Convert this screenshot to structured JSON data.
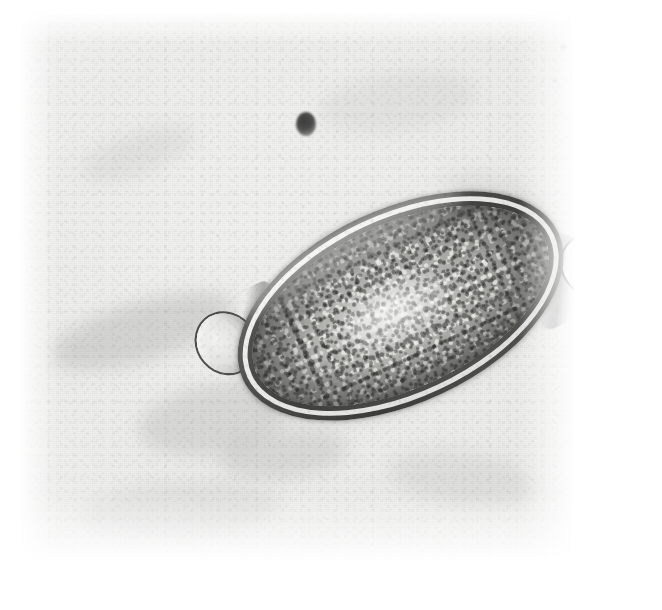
{
  "image": {
    "kind": "light-micrograph",
    "modality": "brightfield light microscopy (halftone printed photograph)",
    "subject": "Trichuris trichiura (whipworm) egg",
    "orientation_degrees": -25,
    "background_tone": "#efefee",
    "paper_tone": "#ffffff",
    "caption": ""
  },
  "field": {
    "left": 18,
    "top": 12,
    "width": 556,
    "height": 548,
    "description": "uniform pale grey out-of-focus slide background with film grain and halftone screen"
  },
  "specimen": {
    "name": "whipworm-egg",
    "shape": "barrel / lemon-shaped (football-shaped)",
    "long_axis_px": 386,
    "short_axis_px": 194,
    "tilt_degrees": -25,
    "shell": {
      "layers": [
        "outer dark rim",
        "clear refractile middle layer",
        "inner dark layer"
      ],
      "rim_color": "#3b3b39",
      "gap_color": "#eeeeec"
    },
    "contents": {
      "label": "granular unsegmented ovum",
      "base_color": "#b3b3b0",
      "highlight_color": "#f2f2ee",
      "granule_dark": "#6a6a67"
    },
    "plugs": [
      {
        "name": "polar-plug-left",
        "position": "anterior / upper-left",
        "appearance": "translucent rounded mucoid plug"
      },
      {
        "name": "polar-plug-right",
        "position": "posterior / lower-right",
        "appearance": "translucent rounded mucoid plug, fainter"
      }
    ]
  },
  "artifacts": [
    {
      "name": "debris-particle",
      "shape": "small dark round spot",
      "left": 296,
      "top": 112,
      "size": 20
    },
    {
      "name": "debris-speckle-cluster",
      "shape": "faint speckled cluster",
      "left": 546,
      "top": 26,
      "width": 96,
      "height": 70
    }
  ]
}
